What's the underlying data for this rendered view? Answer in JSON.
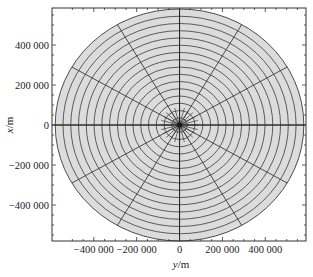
{
  "chart_data": {
    "type": "scatter",
    "subtype": "polar-grid-mesh",
    "title": "",
    "xlabel": "y/m",
    "ylabel": "x/m",
    "xlabel_parts": {
      "var": "y",
      "unit": "/m"
    },
    "ylabel_parts": {
      "var": "x",
      "unit": "/m"
    },
    "xlim": [
      -595000,
      590000
    ],
    "ylim": [
      -580000,
      585000
    ],
    "x_ticks": [
      -400000,
      -200000,
      0,
      200000,
      400000
    ],
    "x_tick_labels": [
      "−400 000",
      "−200 000",
      "0",
      "200 000",
      "400 000"
    ],
    "y_ticks": [
      400000,
      200000,
      0,
      -200000,
      -400000
    ],
    "y_tick_labels": [
      "400 000",
      "200 000",
      "0",
      "−200 000",
      "−400 000"
    ],
    "grid": false,
    "legend": null,
    "mesh": {
      "center": [
        0,
        0
      ],
      "outer_radius_m": 580000,
      "ring_count": 16,
      "main_spoke_angles_deg": [
        0,
        30,
        60,
        90,
        120,
        150,
        180,
        210,
        240,
        270,
        300,
        330
      ],
      "inner_spoke_count": 24,
      "inner_spoke_radius_m": 40000,
      "fill_color": "#dcdcdc",
      "line_color": "#3a3a3a"
    }
  },
  "colors": {
    "background": "#ffffff",
    "disk_fill": "#dcdcdc",
    "mesh_line": "#3a3a3a",
    "axis": "#333333"
  }
}
